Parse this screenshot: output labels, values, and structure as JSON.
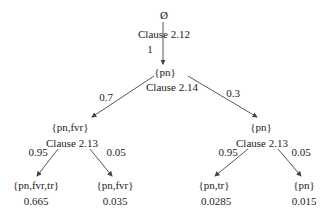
{
  "diagram": {
    "type": "probability-tree",
    "root": {
      "label": "Ø",
      "rule": "Clause 2.12",
      "edge_prob": "1"
    },
    "level1": {
      "label": "{pn}",
      "rule": "Clause 2.14"
    },
    "level2": [
      {
        "label": "{pn,fvr}",
        "edge_prob": "0.7",
        "rule": "Clause 2.13"
      },
      {
        "label": "{pn}",
        "edge_prob": "0.3",
        "rule": "Clause 2.13"
      }
    ],
    "leaves": [
      {
        "label": "{pn,fvr,tr}",
        "edge_prob": "0.95",
        "value": "0.665"
      },
      {
        "label": "{pn,fvr}",
        "edge_prob": "0.05",
        "value": "0.035"
      },
      {
        "label": "{pn,tr}",
        "edge_prob": "0.95",
        "value": "0.0285"
      },
      {
        "label": "{pn}",
        "edge_prob": "0.05",
        "value": "0.015"
      }
    ],
    "colors": {
      "line": "#444444",
      "text": "#222222",
      "background": "#ffffff"
    }
  }
}
